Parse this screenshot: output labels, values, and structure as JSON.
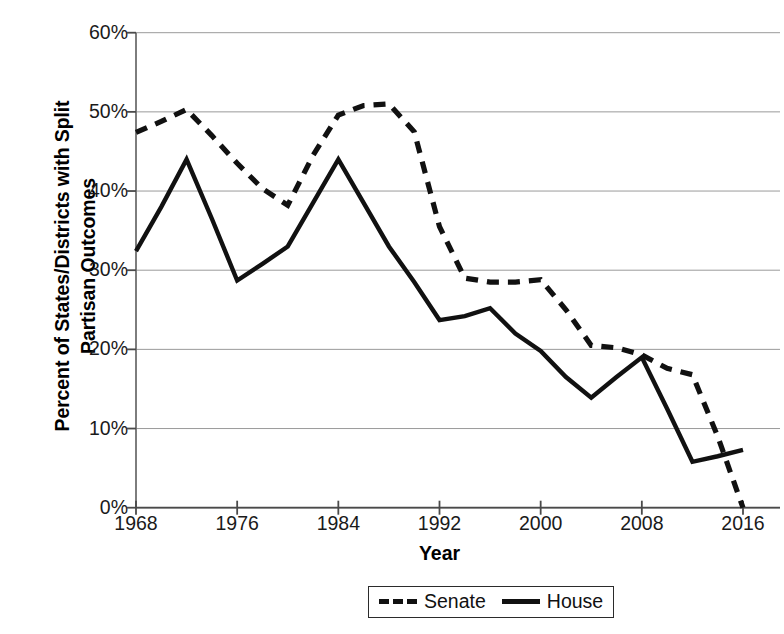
{
  "chart_data": {
    "type": "line",
    "title": "",
    "xlabel": "Year",
    "ylabel": "Percent of States/Districts with Split\nPartisan Outcomes",
    "xlim": [
      1968,
      2016
    ],
    "ylim": [
      0,
      60
    ],
    "x_tick_labels": [
      "1968",
      "1976",
      "1984",
      "1992",
      "2000",
      "2008",
      "2016"
    ],
    "x_ticks": [
      1968,
      1976,
      1984,
      1992,
      2000,
      2008,
      2016
    ],
    "y_tick_labels": [
      "0%",
      "10%",
      "20%",
      "30%",
      "40%",
      "50%",
      "60%"
    ],
    "y_ticks": [
      0,
      10,
      20,
      30,
      40,
      50,
      60
    ],
    "grid": "horizontal",
    "legend_position": "bottom-center",
    "x": [
      1968,
      1970,
      1972,
      1974,
      1976,
      1978,
      1980,
      1982,
      1984,
      1986,
      1988,
      1990,
      1992,
      1994,
      1996,
      1998,
      2000,
      2002,
      2004,
      2006,
      2008,
      2010,
      2012,
      2014,
      2016
    ],
    "series": [
      {
        "name": "Senate",
        "style": "dashed",
        "color": "#111111",
        "values": [
          47.4,
          48.8,
          50.3,
          47.0,
          43.5,
          40.3,
          38.2,
          44.5,
          49.6,
          50.8,
          51.0,
          47.5,
          35.5,
          29.0,
          28.5,
          28.5,
          28.8,
          25.0,
          20.5,
          20.2,
          19.3,
          17.6,
          16.8,
          9.0,
          0.0
        ]
      },
      {
        "name": "House",
        "style": "solid",
        "color": "#111111",
        "values": [
          32.4,
          38.0,
          44.0,
          36.5,
          28.7,
          30.8,
          33.0,
          38.5,
          44.0,
          38.5,
          33.0,
          28.5,
          23.7,
          24.2,
          25.2,
          22.0,
          19.8,
          16.5,
          13.9,
          16.5,
          19.0,
          12.5,
          5.8,
          6.5,
          7.3
        ]
      }
    ],
    "legend": [
      {
        "label": "Senate",
        "style": "dashed"
      },
      {
        "label": "House",
        "style": "solid"
      }
    ]
  },
  "axes": {
    "y_title": "Percent of States/Districts with Split\nPartisan Outcomes",
    "x_title": "Year"
  }
}
